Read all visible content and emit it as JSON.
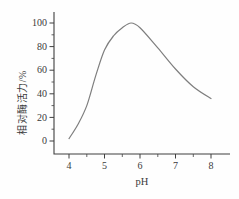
{
  "figure": {
    "background": "#fefefe"
  },
  "chart_data": {
    "type": "line",
    "title": "",
    "xlabel": "pH",
    "ylabel": "相对酶活力/%",
    "series": [
      {
        "name": "relative-enzyme-activity-vs-pH",
        "x": [
          4.0,
          4.25,
          4.5,
          4.75,
          5.0,
          5.25,
          5.5,
          5.75,
          6.0,
          6.5,
          7.0,
          7.5,
          8.0
        ],
        "y": [
          2,
          14,
          30,
          55,
          77,
          89,
          96,
          100,
          96,
          79,
          61,
          46,
          36
        ]
      }
    ],
    "xlim": [
      4,
      8
    ],
    "ylim": [
      0,
      100
    ],
    "x_major_ticks": [
      4,
      5,
      6,
      7,
      8
    ],
    "x_minor_ticks": [
      4.5,
      5.5,
      6.5,
      7.5
    ],
    "y_major_ticks": [
      0,
      20,
      40,
      60,
      80,
      100
    ],
    "y_minor_ticks": [
      10,
      30,
      50,
      70,
      90
    ],
    "grid": false,
    "legend": null,
    "colors": {
      "curve": "#7e7e7e",
      "axis": "#3f3f3f",
      "text": "#3a3a3a"
    }
  }
}
